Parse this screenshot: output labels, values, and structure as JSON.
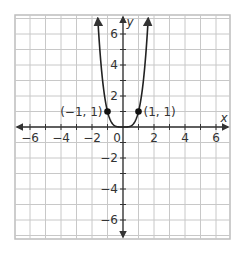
{
  "chart_data": {
    "type": "line",
    "title": "",
    "function": "y = x^4",
    "xlabel": "x",
    "ylabel": "y",
    "xlim": [
      -7,
      7
    ],
    "ylim": [
      -7,
      7
    ],
    "grid": true,
    "x_ticks": [
      -6,
      -4,
      -2,
      2,
      4,
      6
    ],
    "y_ticks": [
      -6,
      -4,
      -2,
      2,
      4,
      6
    ],
    "origin_label": "0",
    "series": [
      {
        "name": "y = x^4",
        "x": [
          -1.627,
          -1.5,
          -1.25,
          -1,
          -0.75,
          -0.5,
          -0.25,
          0,
          0.25,
          0.5,
          0.75,
          1,
          1.25,
          1.5,
          1.627
        ],
        "y": [
          7.0,
          5.06,
          2.44,
          1,
          0.32,
          0.06,
          0.004,
          0,
          0.004,
          0.06,
          0.32,
          1,
          2.44,
          5.06,
          7.0
        ],
        "arrows": "both-ends-up"
      }
    ],
    "points": [
      {
        "x": -1,
        "y": 1,
        "label": "(−1, 1)"
      },
      {
        "x": 1,
        "y": 1,
        "label": "(1, 1)"
      }
    ]
  },
  "layout": {
    "origin_px": [
      123,
      127
    ],
    "unit_px": 15.5,
    "grid_bounds_px": {
      "left": 15,
      "top": 15,
      "right": 230,
      "bottom": 239
    },
    "colors": {
      "grid": "#c8c8c8",
      "axis": "#333333",
      "curve": "#222222",
      "point": "#111111",
      "frame": "#bdbdbd"
    }
  }
}
